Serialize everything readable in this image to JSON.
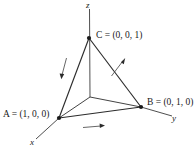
{
  "figure": {
    "kind": "3d-coordinate-diagram",
    "background_color": "#ffffff",
    "line_color": "#2b2b2b",
    "axes": [
      {
        "name": "x-axis",
        "label": "x"
      },
      {
        "name": "y-axis",
        "label": "y"
      },
      {
        "name": "z-axis",
        "label": "z"
      }
    ],
    "points": [
      {
        "name": "A",
        "label": "A = (1, 0, 0)",
        "symbol": "A",
        "coords": "(1, 0, 0)"
      },
      {
        "name": "B",
        "label": "B = (0, 1, 0)",
        "symbol": "B",
        "coords": "(0, 1, 0)"
      },
      {
        "name": "C",
        "label": "C = (0, 0, 1)",
        "symbol": "C",
        "coords": "(0, 0, 1)"
      }
    ],
    "edges": [
      {
        "name": "edge-A-to-B",
        "from": "A",
        "to": "B",
        "direction_arrow": "right"
      },
      {
        "name": "edge-B-to-C",
        "from": "B",
        "to": "C",
        "direction_arrow": "up-right"
      },
      {
        "name": "edge-C-to-A",
        "from": "C",
        "to": "A",
        "direction_arrow": "down-left"
      }
    ],
    "labels": {
      "A": "A = (1, 0, 0)",
      "B": "B = (0, 1, 0)",
      "C": "C = (0, 0, 1)",
      "x": "x",
      "y": "y",
      "z": "z"
    }
  }
}
